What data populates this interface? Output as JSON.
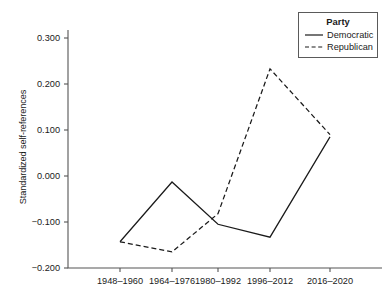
{
  "chart_data": {
    "type": "line",
    "title": "",
    "xlabel": "",
    "ylabel": "Standardized self-references",
    "categories": [
      "1948–1960",
      "1964–1976",
      "1980–1992",
      "1996–2012",
      "2016–2020"
    ],
    "series": [
      {
        "name": "Democratic",
        "style": "solid",
        "color": "#1a1a1a",
        "values": [
          -0.143,
          -0.013,
          -0.105,
          -0.133,
          0.085
        ]
      },
      {
        "name": "Republican",
        "style": "dashed",
        "color": "#1a1a1a",
        "values": [
          -0.143,
          -0.165,
          -0.082,
          0.233,
          0.09
        ]
      }
    ],
    "ylim": [
      -0.22,
      0.32
    ],
    "yticks": [
      0.3,
      0.2,
      0.1,
      0.0,
      -0.1,
      -0.2
    ],
    "ytick_labels": [
      "0.300",
      "0.200",
      "0.100",
      "0.000",
      "−0.100",
      "−0.200"
    ],
    "grid": false,
    "legend_position": "top-right"
  },
  "legend": {
    "title": "Party",
    "entries": [
      {
        "label": "Democratic",
        "style": "solid"
      },
      {
        "label": "Republican",
        "style": "dashed"
      }
    ]
  },
  "axes": {
    "y_title": "Standardized self-references"
  }
}
